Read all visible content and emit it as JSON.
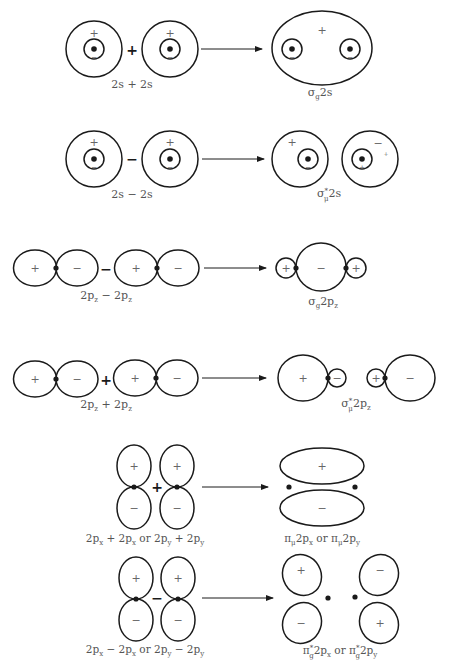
{
  "header": {
    "text": ""
  },
  "colors": {
    "stroke": "#1a1a1a",
    "sign_text": "#666666",
    "label_text": "#555555",
    "background": "#ffffff"
  },
  "rows": [
    {
      "id": "row-2s-plus",
      "operator": "+",
      "left_label": "2s + 2s",
      "result_label": {
        "main": "σ",
        "sub": "g",
        "sup": "",
        "rest": "2s"
      },
      "left_signs": [
        "+",
        "−",
        "+",
        "−"
      ],
      "result_signs": [
        "+",
        "−",
        "−"
      ]
    },
    {
      "id": "row-2s-minus",
      "operator": "−",
      "left_label": "2s − 2s",
      "result_label": {
        "main": "σ",
        "sub": "μ",
        "sup": "*",
        "rest": "2s"
      },
      "left_signs": [
        "+",
        "−",
        "+",
        "−"
      ],
      "result_signs": [
        "+",
        "−",
        "−",
        "+",
        "+"
      ]
    },
    {
      "id": "row-2pz-minus",
      "operator": "−",
      "left_label": {
        "a": "2p",
        "a_sub": "z",
        "op": " − ",
        "b": "2p",
        "b_sub": "z"
      },
      "result_label": {
        "main": "σ",
        "sub": "g",
        "sup": "",
        "rest": "2p",
        "rest_sub": "z"
      },
      "left_signs": [
        "+",
        "−",
        "+",
        "−"
      ],
      "result_signs": [
        "+",
        "−",
        "+"
      ]
    },
    {
      "id": "row-2pz-plus",
      "operator": "+",
      "left_label": {
        "a": "2p",
        "a_sub": "z",
        "op": " + ",
        "b": "2p",
        "b_sub": "z"
      },
      "result_label": {
        "main": "σ",
        "sub": "μ",
        "sup": "*",
        "rest": "2p",
        "rest_sub": "z"
      },
      "left_signs": [
        "+",
        "−",
        "+",
        "−"
      ],
      "result_signs": [
        "+",
        "−",
        "+",
        "−"
      ]
    },
    {
      "id": "row-2px-plus",
      "operator": "+",
      "left_label": "2pₓ + 2pₓ or 2pᵧ + 2pᵧ",
      "result_label": "πμ2pₓ or πμ2pᵧ",
      "left_signs": [
        "+",
        "+",
        "−",
        "−"
      ],
      "result_signs": [
        "+",
        "−"
      ]
    },
    {
      "id": "row-2px-minus",
      "operator": "−",
      "left_label": "2pₓ − 2pₓ or 2pᵧ − 2pᵧ",
      "result_label": "π*g2pₓ or π*g2pᵧ",
      "left_signs": [
        "+",
        "+",
        "−",
        "−"
      ],
      "result_signs": [
        "+",
        "−",
        "−",
        "+"
      ]
    }
  ],
  "labels": {
    "r1_left": "2s + 2s",
    "r1_res_main": "σ",
    "r1_res_sub": "g",
    "r1_res_rest": "2s",
    "r2_left": "2s − 2s",
    "r2_res_main": "σ",
    "r2_res_sup": "*",
    "r2_res_sub": "μ",
    "r2_res_rest": "2s",
    "r3_a": "2p",
    "r3_a_sub": "z",
    "r3_op": " − ",
    "r3_b": "2p",
    "r3_b_sub": "z",
    "r3_res_main": "σ",
    "r3_res_sub": "g",
    "r3_res_rest": "2p",
    "r3_res_rest_sub": "z",
    "r4_a": "2p",
    "r4_a_sub": "z",
    "r4_op": " + ",
    "r4_b": "2p",
    "r4_b_sub": "z",
    "r4_res_main": "σ",
    "r4_res_sup": "*",
    "r4_res_sub": "μ",
    "r4_res_rest": "2p",
    "r4_res_rest_sub": "z",
    "r5_p1": "2p",
    "r5_s1": "x",
    "r5_o1": " + 2p",
    "r5_s2": "x",
    "r5_or": " or 2p",
    "r5_s3": "y",
    "r5_o2": " + 2p",
    "r5_s4": "y",
    "r5_res_pi": "π",
    "r5_res_sub1": "μ",
    "r5_res_mid": "2p",
    "r5_res_sub2": "x",
    "r5_res_or": " or π",
    "r5_res_sub3": "μ",
    "r5_res_end": "2p",
    "r5_res_sub4": "y",
    "r6_p1": "2p",
    "r6_s1": "x",
    "r6_o1": " − 2p",
    "r6_s2": "x",
    "r6_or": " or 2p",
    "r6_s3": "y",
    "r6_o2": " − 2p",
    "r6_s4": "y",
    "r6_res_pi": "π",
    "r6_res_sup1": "*",
    "r6_res_sub1": "g",
    "r6_res_mid": "2p",
    "r6_res_sub2": "x",
    "r6_res_or": " or π",
    "r6_res_sup3": "*",
    "r6_res_sub3": "g",
    "r6_res_end": "2p",
    "r6_res_sub4": "y"
  },
  "signs": {
    "plus": "+",
    "minus": "−"
  }
}
